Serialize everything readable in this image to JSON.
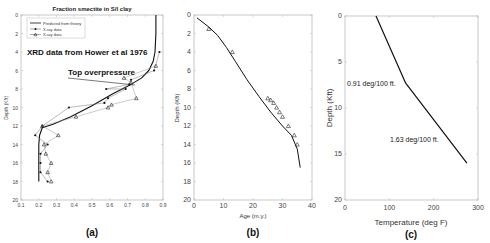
{
  "figure": {
    "panels": [
      "(a)",
      "(b)",
      "(c)"
    ]
  },
  "panel_a": {
    "label": "(a)",
    "title": "Fraction smectite in S/I clay",
    "ylabel": "Depth (Kft)",
    "xticks": [
      "0.1",
      "0.2",
      "0.3",
      "0.4",
      "0.5",
      "0.6",
      "0.7",
      "0.8",
      "0.9"
    ],
    "yticks": [
      "0",
      "2",
      "4",
      "6",
      "8",
      "10",
      "12",
      "14",
      "16",
      "18",
      "20"
    ],
    "legend": [
      "Predicted from theory",
      "X-ray data",
      "X-ray data"
    ],
    "annotation_source": "XRD data from Hower et al 1976",
    "annotation_overpressure": "Top overpressure"
  },
  "panel_b": {
    "label": "(b)",
    "xlabel": "Age (m.y.)",
    "ylabel": "Depth (Kft)",
    "xticks": [
      "0",
      "10",
      "20",
      "30",
      "40"
    ],
    "yticks": [
      "0",
      "2",
      "4",
      "6",
      "8",
      "10",
      "12",
      "14",
      "16",
      "18",
      "20"
    ]
  },
  "panel_c": {
    "label": "(c)",
    "xlabel": "Temperature (deg F)",
    "ylabel": "Depth (Kft)",
    "xticks": [
      "0",
      "100",
      "200",
      "300"
    ],
    "yticks": [
      "0",
      "5",
      "10",
      "15",
      "20"
    ],
    "annotation_upper": "0.91 deg/100 ft.",
    "annotation_lower": "1.63 deg/100 ft."
  },
  "chart_data": [
    {
      "type": "line",
      "title": "Fraction smectite in S/I clay",
      "xlabel": "",
      "ylabel": "Depth (Kft)",
      "xlim": [
        0.1,
        0.9
      ],
      "ylim": [
        20,
        0
      ],
      "y_inverted": true,
      "legend_position": "upper-left",
      "annotations": [
        "XRD data from Hower et al 1976",
        "Top overpressure"
      ],
      "series": [
        {
          "name": "Predicted from theory",
          "marker": "none",
          "x": [
            0.86,
            0.86,
            0.855,
            0.845,
            0.82,
            0.78,
            0.72,
            0.62,
            0.5,
            0.38,
            0.28,
            0.22,
            0.205,
            0.2,
            0.2,
            0.2
          ],
          "y": [
            0,
            2,
            4,
            5,
            6,
            6.8,
            7.5,
            8.5,
            9.8,
            11,
            11.8,
            12.2,
            13,
            14,
            16,
            18
          ]
        },
        {
          "name": "X-ray data",
          "marker": "dot",
          "x": [
            0.88,
            0.85,
            0.72,
            0.71,
            0.58,
            0.69,
            0.59,
            0.57,
            0.37,
            0.22,
            0.18,
            0.25,
            0.21,
            0.21,
            0.21,
            0.25
          ],
          "y": [
            4,
            6,
            7,
            7.5,
            8,
            8,
            9,
            9.5,
            10,
            12,
            13,
            14,
            15,
            16,
            17,
            18
          ]
        },
        {
          "name": "X-ray data",
          "marker": "triangle",
          "x": [
            0.86,
            0.68,
            0.72,
            0.75,
            0.61,
            0.59,
            0.41,
            0.22,
            0.31,
            0.23,
            0.24,
            0.27,
            0.25,
            0.27
          ],
          "y": [
            5.5,
            6.8,
            7.3,
            9,
            9.7,
            10,
            11,
            12,
            13,
            14,
            15,
            16,
            17,
            18
          ]
        }
      ]
    },
    {
      "type": "line",
      "title": "",
      "xlabel": "Age (m.y.)",
      "ylabel": "Depth (Kft)",
      "xlim": [
        0,
        40
      ],
      "ylim": [
        20,
        0
      ],
      "y_inverted": true,
      "series": [
        {
          "name": "Predicted",
          "marker": "none",
          "x": [
            1,
            5,
            8,
            11,
            14,
            18,
            22,
            26,
            30,
            33,
            35,
            36
          ],
          "y": [
            0.3,
            1.3,
            2.2,
            3.5,
            5,
            7,
            8.8,
            10.5,
            12,
            13,
            14.5,
            16.5
          ]
        },
        {
          "name": "Data",
          "marker": "triangle",
          "x": [
            5,
            13,
            25,
            26,
            27,
            28,
            29,
            30,
            32,
            34,
            35
          ],
          "y": [
            1.5,
            4,
            9,
            9.2,
            9.5,
            10,
            10.5,
            11,
            12,
            13,
            14
          ]
        }
      ]
    },
    {
      "type": "line",
      "title": "",
      "xlabel": "Temperature (deg F)",
      "ylabel": "Depth (Kft)",
      "xlim": [
        0,
        300
      ],
      "ylim": [
        20,
        0
      ],
      "y_inverted": true,
      "annotations": [
        "0.91 deg/100 ft.",
        "1.63 deg/100 ft."
      ],
      "series": [
        {
          "name": "Geotherm",
          "marker": "none",
          "x": [
            70,
            137,
            275
          ],
          "y": [
            0,
            7.3,
            16
          ]
        }
      ]
    }
  ]
}
